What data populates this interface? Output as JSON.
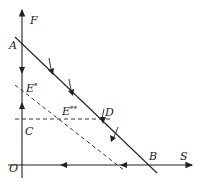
{
  "diagram": {
    "type": "supply-demand / factor-price line diagram",
    "axes": {
      "vertical": {
        "label": "F",
        "origin_label": "O"
      },
      "horizontal": {
        "label": "S"
      }
    },
    "points": {
      "A": "A",
      "B": "B",
      "C": "C",
      "D": "D",
      "E1": "E",
      "E1_mark": "*",
      "E2": "E",
      "E2_mark": "**"
    },
    "lines": [
      {
        "name": "AB",
        "style": "solid",
        "from": "A",
        "to": "B",
        "arrows": "three downward arrows along line"
      },
      {
        "name": "dashed-diagonal",
        "style": "dashed",
        "through": [
          "E*",
          "E**"
        ]
      },
      {
        "name": "dashed-horizontal",
        "style": "dashed",
        "through": [
          "C",
          "E**",
          "D"
        ]
      }
    ],
    "colors": {
      "ink": "#222222",
      "background": "#ffffff"
    }
  }
}
